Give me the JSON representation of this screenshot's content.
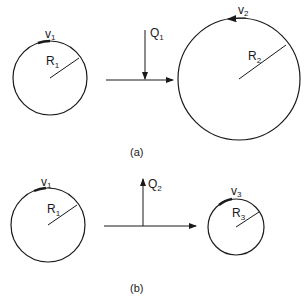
{
  "panels": [
    {
      "caption": "(a)",
      "left_circle": {
        "label": "R",
        "sub": "1",
        "v_label": "v",
        "v_sub": "1"
      },
      "heat": {
        "label": "Q",
        "sub": "1",
        "direction": "down"
      },
      "right_circle": {
        "label": "R",
        "sub": "2",
        "v_label": "v",
        "v_sub": "2"
      }
    },
    {
      "caption": "(b)",
      "left_circle": {
        "label": "R",
        "sub": "1",
        "v_label": "v",
        "v_sub": "1"
      },
      "heat": {
        "label": "Q",
        "sub": "2",
        "direction": "up"
      },
      "right_circle": {
        "label": "R",
        "sub": "3",
        "v_label": "v",
        "v_sub": "3"
      }
    }
  ],
  "colors": {
    "stroke": "#1a1a1a",
    "background": "#ffffff"
  }
}
